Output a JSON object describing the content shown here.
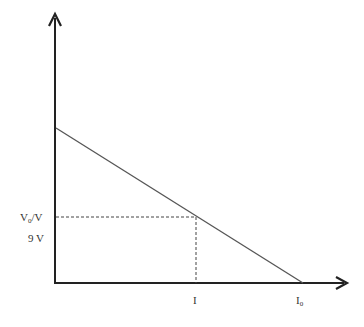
{
  "diagram": {
    "type": "voltage-current graph",
    "colors": {
      "axis": "#222222",
      "line": "#555555",
      "dashed": "#444444",
      "text": "#333333",
      "background": "#ffffff"
    },
    "y_axis": {
      "labels": [
        {
          "main": "V",
          "sub": "0",
          "suffix": "/V"
        },
        {
          "text": "9 V"
        }
      ]
    },
    "x_axis": {
      "labels": [
        {
          "text": "I"
        },
        {
          "main": "I",
          "sub": "0"
        }
      ]
    },
    "line": {
      "description": "Straight line decreasing from y-intercept to x-intercept I0"
    }
  }
}
